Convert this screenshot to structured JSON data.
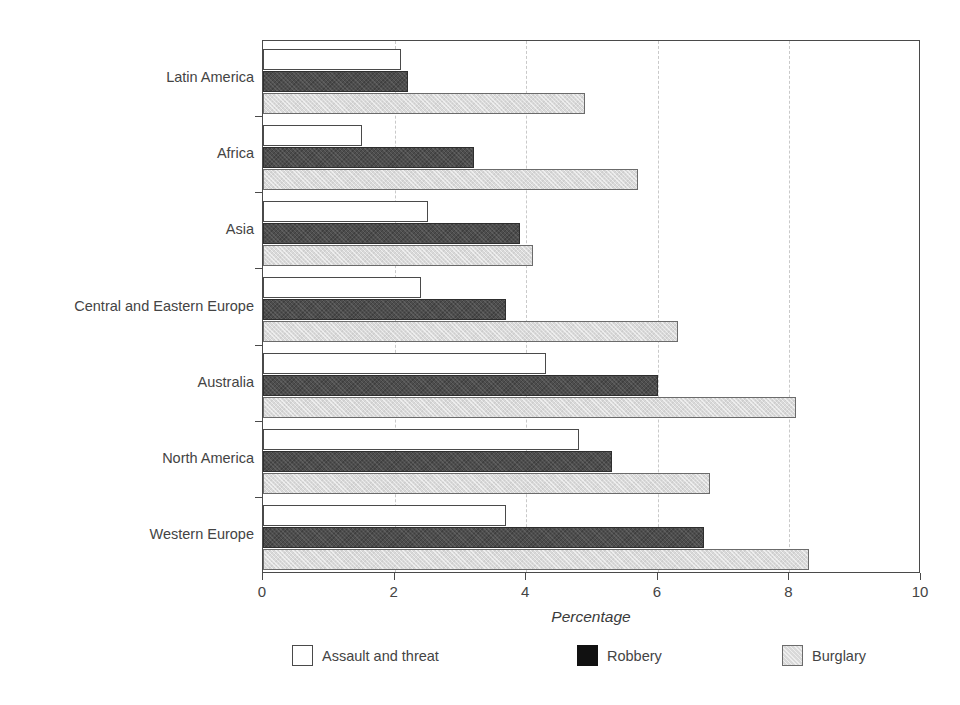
{
  "chart_data": {
    "type": "bar",
    "orientation": "horizontal",
    "title": "",
    "subtitle": "",
    "xlabel": "Percentage",
    "ylabel": "",
    "xlim": [
      0,
      10
    ],
    "xticks": [
      0,
      2,
      4,
      6,
      8,
      10
    ],
    "xtick_labels": [
      "0",
      "2",
      "4",
      "6",
      "8",
      "10"
    ],
    "grid": "vertical dashed gridlines at 2, 4, 6, 8",
    "legend_position": "bottom",
    "categories": [
      "Latin America",
      "Africa",
      "Asia",
      "Central and Eastern Europe",
      "Australia",
      "North America",
      "Western Europe"
    ],
    "series": [
      {
        "name": "Assault and threat",
        "color": "#ffffff",
        "edge_color": "#4a4a4a",
        "values": [
          2.1,
          1.5,
          2.5,
          2.4,
          4.3,
          4.8,
          3.7
        ]
      },
      {
        "name": "Robbery",
        "color": "#4d4d4d",
        "edge_color": "#2e2e2e",
        "values": [
          2.2,
          3.2,
          3.9,
          3.7,
          6.0,
          5.3,
          6.7
        ]
      },
      {
        "name": "Burglary",
        "color": "#d9d9d9",
        "edge_color": "#6b6b6b",
        "values": [
          4.9,
          5.7,
          4.1,
          6.3,
          8.1,
          6.8,
          8.3
        ]
      }
    ]
  },
  "axis": {
    "x_title": "Percentage",
    "tick_labels": [
      "0",
      "2",
      "4",
      "6",
      "8",
      "10"
    ]
  },
  "legend": {
    "items": [
      {
        "label": "Assault and threat",
        "swatch": "assault"
      },
      {
        "label": "Robbery",
        "swatch": "robbery"
      },
      {
        "label": "Burglary",
        "swatch": "burglary"
      }
    ]
  }
}
